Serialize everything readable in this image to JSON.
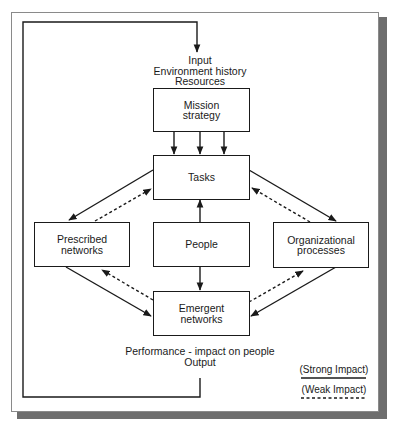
{
  "diagram": {
    "input_block": {
      "lines": [
        "Input",
        "Environment history",
        "Resources"
      ]
    },
    "nodes": {
      "mission": {
        "lines": [
          "Mission",
          "strategy"
        ]
      },
      "tasks": {
        "lines": [
          "Tasks"
        ]
      },
      "prescribed": {
        "lines": [
          "Prescribed",
          "networks"
        ]
      },
      "people": {
        "lines": [
          "People"
        ]
      },
      "organizational": {
        "lines": [
          "Organizational",
          "processes"
        ]
      },
      "emergent": {
        "lines": [
          "Emergent",
          "networks"
        ]
      }
    },
    "output_block": {
      "lines": [
        "Performance - impact on people",
        "Output"
      ]
    },
    "legend": {
      "strong": "(Strong Impact)",
      "weak": "(Weak Impact)"
    },
    "edges": [
      {
        "from": "input",
        "to": "mission",
        "style": "strong"
      },
      {
        "from": "mission",
        "to": "tasks",
        "style": "strong",
        "count": 3
      },
      {
        "from": "people",
        "to": "tasks",
        "style": "strong"
      },
      {
        "from": "people",
        "to": "emergent",
        "style": "strong"
      },
      {
        "from": "tasks",
        "to": "prescribed",
        "style": "strong"
      },
      {
        "from": "prescribed",
        "to": "tasks",
        "style": "weak"
      },
      {
        "from": "tasks",
        "to": "organizational",
        "style": "strong"
      },
      {
        "from": "organizational",
        "to": "tasks",
        "style": "weak"
      },
      {
        "from": "prescribed",
        "to": "emergent",
        "style": "strong"
      },
      {
        "from": "emergent",
        "to": "prescribed",
        "style": "weak"
      },
      {
        "from": "organizational",
        "to": "emergent",
        "style": "strong"
      },
      {
        "from": "emergent",
        "to": "organizational",
        "style": "weak"
      },
      {
        "from": "output",
        "to": "input",
        "style": "strong",
        "note": "feedback loop"
      }
    ],
    "colors": {
      "line": "#1a1a1a",
      "shadow": "#6e6e6e",
      "frame": "#8a8a8a"
    }
  }
}
